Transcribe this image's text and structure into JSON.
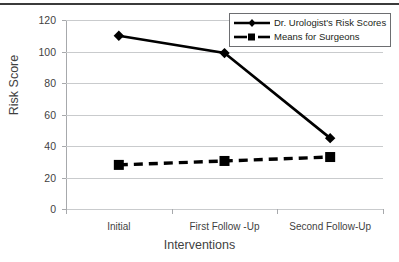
{
  "chart_data": {
    "type": "line",
    "title": "",
    "xlabel": "Interventions",
    "ylabel": "Risk Score",
    "categories": [
      "Initial",
      "First Follow -Up",
      "Second Follow-Up"
    ],
    "ylim": [
      0,
      120
    ],
    "yticks": [
      0,
      20,
      40,
      60,
      80,
      100,
      120
    ],
    "ytick_labels": [
      "0",
      "20",
      "40",
      "60",
      "80",
      "100",
      "120"
    ],
    "grid": true,
    "legend_position": "top-right",
    "series": [
      {
        "name": "Dr. Urologist's Risk Scores",
        "values": [
          110,
          99,
          45
        ],
        "marker": "diamond",
        "line_style": "solid",
        "color": "#000000"
      },
      {
        "name": "Means for Surgeons",
        "values": [
          28,
          30.5,
          33
        ],
        "marker": "square",
        "line_style": "dashed",
        "color": "#000000"
      }
    ]
  },
  "legend": {
    "items": [
      {
        "label": "Dr. Urologist's Risk Scores",
        "marker": "diamond-marker-icon"
      },
      {
        "label": "Means for Surgeons",
        "marker": "square-marker-icon"
      }
    ]
  },
  "colors": {
    "series": "#000000",
    "gridline": "#c9cbcd",
    "axis": "#a7a9ac",
    "text": "#3f3f3f",
    "rule": "#3b3b3b"
  }
}
